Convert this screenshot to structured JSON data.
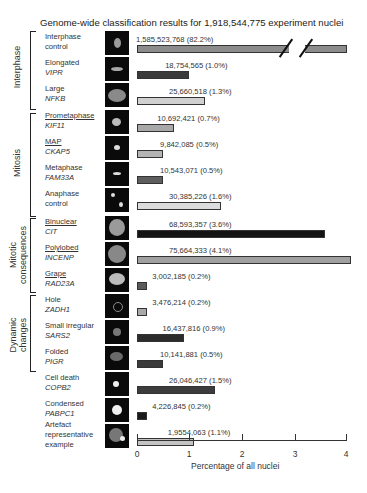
{
  "chart_data": {
    "type": "bar",
    "orientation": "horizontal",
    "title": "Genome-wide classification results for 1,918,544,775 experiment nuclei",
    "xlabel": "Percentage of all nuclei",
    "ylabel": "",
    "xlim": [
      0,
      4
    ],
    "xticks": [
      "0",
      "1",
      "2",
      "3",
      "4"
    ],
    "axis_break": "Interphase control bar broken (82.2%)",
    "groups": [
      {
        "name": "Interphase",
        "rows": [
          0,
          1,
          2
        ]
      },
      {
        "name": "Mitosis",
        "rows": [
          3,
          4,
          5,
          6
        ]
      },
      {
        "name": "Mitotic consequences",
        "rows": [
          7,
          8,
          9
        ]
      },
      {
        "name": "Dynamic changes",
        "rows": [
          10,
          11,
          12
        ]
      }
    ],
    "categories": [
      "Interphase control",
      "Elongated VIPR",
      "Large NFKB",
      "Prometaphase KIF11",
      "MAP CKAP5",
      "Metaphase FAM33A",
      "Anaphase control",
      "Binuclear CIT",
      "Polylobed INCENP",
      "Grape RAD23A",
      "Hole ZADH1",
      "Small irregular SARS2",
      "Folded PIGR",
      "Cell death COPB2",
      "Condensed PABPC1",
      "Artefact representative example"
    ],
    "values": [
      82.2,
      1.0,
      1.3,
      0.7,
      0.5,
      0.5,
      1.6,
      3.6,
      4.1,
      0.2,
      0.2,
      0.9,
      0.5,
      1.5,
      0.2,
      1.1
    ],
    "counts": [
      "1,585,523,768",
      "18,754,565",
      "25,660,518",
      "10,692,421",
      "9,842,085",
      "10,543,071",
      "30,385,226",
      "68,593,357",
      "75,664,333",
      "3,002,185",
      "3,476,214",
      "16,437,816",
      "10,141,881",
      "26,046,427",
      "4,226,845",
      "1,9554,063"
    ]
  },
  "title": "Genome-wide classification results for 1,918,544,775 experiment nuclei",
  "groups": {
    "interphase": "Interphase",
    "mitosis": "Mitosis",
    "mitotic_1": "Mitotic",
    "mitotic_2": "consequences",
    "dynamic_1": "Dynamic",
    "dynamic_2": "changes"
  },
  "rows": [
    {
      "l1": "Interphase",
      "l2": "control",
      "l2_italic": false,
      "value": "1,585,523,768 (82.2%)",
      "color": "#8c8c8c"
    },
    {
      "l1": "Elongated",
      "l2": "VIPR",
      "value": "18,754,565 (1.0%)",
      "color": "#3a3a3a"
    },
    {
      "l1": "Large",
      "l2": "NFKB",
      "value": "25,660,518 (1.3%)",
      "color": "#d0d0d0"
    },
    {
      "l1": "Prometaphase",
      "l2": "KIF11",
      "value": "10,692,421 (0.7%)",
      "color": "#a8a8a8"
    },
    {
      "l1": "MAP",
      "l2": "CKAP5",
      "value": "9,842,085 (0.5%)",
      "color": "#b4b4b4"
    },
    {
      "l1": "Metaphase",
      "l2": "FAM33A",
      "value": "10,543,071 (0.5%)",
      "color": "#5e5e5e"
    },
    {
      "l1": "Anaphase",
      "l2": "control",
      "value": "30,385,226 (1.6%)",
      "color": "#dcdcdc"
    },
    {
      "l1": "Binuclear",
      "l2": "CIT",
      "value": "68,593,357 (3.6%)",
      "color": "#141414"
    },
    {
      "l1": "Polylobed",
      "l2": "INCENP",
      "value": "75,664,333 (4.1%)",
      "color": "#a0a0a0"
    },
    {
      "l1": "Grape",
      "l2": "RAD23A",
      "value": "3,002,185 (0.2%)",
      "color": "#5a5a5a"
    },
    {
      "l1": "Hole",
      "l2": "ZADH1",
      "value": "3,476,214 (0.2%)",
      "color": "#a8a8a8"
    },
    {
      "l1": "Small irregular",
      "l2": "SARS2",
      "value": "16,437,816 (0.9%)",
      "color": "#2c2c2c"
    },
    {
      "l1": "Folded",
      "l2": "PIGR",
      "value": "10,141,881 (0.5%)",
      "color": "#3a3a3a"
    },
    {
      "l1": "Cell death",
      "l2": "COPB2",
      "value": "26,046,427 (1.5%)",
      "color": "#3c3c3c"
    },
    {
      "l1": "Condensed",
      "l2": "PABPC1",
      "value": "4,226,845 (0.2%)",
      "color": "#1a1a1a"
    },
    {
      "l1": "Artefact",
      "l2": "representative",
      "l3": "example",
      "value": "1,9554,063 (1.1%)",
      "color": "#c4c4c4"
    }
  ],
  "axis": {
    "ticks": [
      "0",
      "1",
      "2",
      "3",
      "4"
    ],
    "label": "Percentage of all nuclei"
  }
}
